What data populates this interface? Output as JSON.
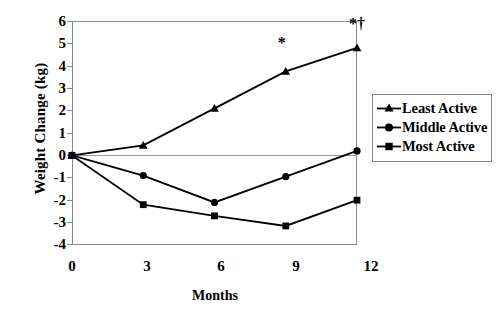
{
  "chart_data": {
    "type": "line",
    "title": "",
    "xlabel": "Months",
    "ylabel": "Weight Change (kg)",
    "x": [
      0,
      3,
      6,
      9,
      12
    ],
    "xticklabels": [
      "0",
      "3",
      "6",
      "9",
      "12"
    ],
    "yticklabels": [
      "6",
      "5",
      "4",
      "3",
      "2",
      "1",
      "0",
      "-1",
      "-2",
      "-3",
      "-4"
    ],
    "xlim": [
      0,
      12
    ],
    "ylim": [
      -4,
      6
    ],
    "grid": false,
    "legend_position": "right",
    "zero_line": true,
    "series": [
      {
        "name": "Least Active",
        "marker": "triangle",
        "values": [
          0.0,
          0.45,
          2.1,
          3.75,
          4.8
        ]
      },
      {
        "name": "Middle Active",
        "marker": "circle",
        "values": [
          0.0,
          -0.9,
          -2.1,
          -0.95,
          0.2
        ]
      },
      {
        "name": "Most Active",
        "marker": "square",
        "values": [
          0.0,
          -2.2,
          -2.7,
          -3.15,
          -2.0
        ]
      }
    ],
    "annotations": [
      {
        "text": "*",
        "x": 9,
        "y": 5.0
      },
      {
        "text": "*†",
        "x": 12,
        "y": 5.85
      }
    ]
  },
  "legend": {
    "items": [
      {
        "label": "Least Active",
        "marker": "triangle-marker-icon"
      },
      {
        "label": "Middle Active",
        "marker": "circle-marker-icon"
      },
      {
        "label": "Most Active",
        "marker": "square-marker-icon"
      }
    ]
  },
  "colors": {
    "series": "#000000",
    "axis": "#8a8a8a",
    "background": "#ffffff"
  }
}
